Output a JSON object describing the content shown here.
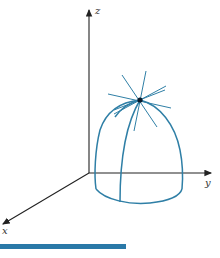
{
  "figure": {
    "type": "3d-surface-diagram",
    "axes": {
      "x": {
        "label": "x"
      },
      "y": {
        "label": "y"
      },
      "z": {
        "label": "z"
      }
    },
    "colors": {
      "surface": "#2f7fa6",
      "axes": "#222222",
      "point": "#0a1a2a",
      "bar": "#2a79a8"
    }
  }
}
